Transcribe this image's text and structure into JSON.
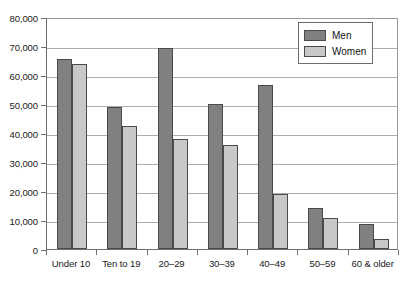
{
  "chart_data": {
    "type": "bar",
    "title": "",
    "subtitle": "",
    "xlabel": "",
    "ylabel": "",
    "ylim": [
      0,
      80000
    ],
    "ytick_step": 10000,
    "ytick_labels": [
      "0",
      "10,000",
      "20,000",
      "30,000",
      "40,000",
      "50,000",
      "60,000",
      "70,000",
      "80,000"
    ],
    "ytick_values": [
      0,
      10000,
      20000,
      30000,
      40000,
      50000,
      60000,
      70000,
      80000
    ],
    "grid": true,
    "grid_axis": "y",
    "legend_position": "top-right",
    "categories": [
      "Under 10",
      "Ten to 19",
      "20–29",
      "30–39",
      "40–49",
      "50–59",
      "60 & older"
    ],
    "series": [
      {
        "name": "Men",
        "color": "#808080",
        "values": [
          65500,
          48800,
          69300,
          50000,
          56500,
          14200,
          8500
        ]
      },
      {
        "name": "Women",
        "color": "#c8c8c8",
        "values": [
          63800,
          42300,
          38000,
          36000,
          18800,
          10800,
          3400
        ]
      }
    ]
  },
  "legend": {
    "entries": [
      {
        "label": "Men"
      },
      {
        "label": "Women"
      }
    ]
  },
  "colors": {
    "men": "#808080",
    "women": "#c8c8c8",
    "bar_outline": "#4a4a4a",
    "gridline": "#aeaeae",
    "axis": "#6e6e6e",
    "text": "#1a1a1a",
    "background": "#ffffff"
  }
}
